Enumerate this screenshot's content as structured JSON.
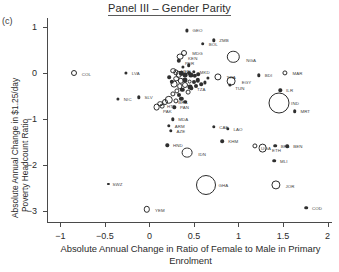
{
  "panel_marker": "(c)",
  "chart_data": {
    "type": "scatter",
    "title": "Panel III – Gender Parity",
    "xlabel": "Absolute Annual Change in Ratio of Female to Male in Primary Enrolment",
    "ylabel_line1": "Absolute Annual Change in $1.25/day",
    "ylabel_line2": "Poverty Headcount Ratio",
    "xlim": [
      -1.15,
      2.05
    ],
    "ylim": [
      -3.25,
      1.2
    ],
    "xticks": [
      -1,
      -0.5,
      0,
      0.5,
      1,
      1.5,
      2
    ],
    "xticklabels": [
      "−1",
      "−0.5",
      "0",
      "0.5",
      "1",
      "1.5",
      "2"
    ],
    "yticks": [
      1,
      0,
      -1,
      -2,
      -3
    ],
    "yticklabels": [
      "1",
      "0",
      "−1",
      "−2",
      "−3"
    ],
    "grid": false,
    "legend": null,
    "marker_note": "Bubble area encodes population; open circles are large bubbles, filled dots are small bubbles",
    "points": [
      {
        "label": "GEO",
        "x": 0.42,
        "y": 0.93,
        "r": 1.6,
        "style": "filled",
        "lx": 4,
        "ly": 0
      },
      {
        "label": "BOL",
        "x": 0.6,
        "y": 0.64,
        "r": 1.8,
        "style": "filled",
        "lx": 4,
        "ly": 0
      },
      {
        "label": "ZMB",
        "x": 0.72,
        "y": 0.72,
        "r": 1.7,
        "style": "filled",
        "lx": 4,
        "ly": 0
      },
      {
        "label": "MDG",
        "x": 0.39,
        "y": 0.44,
        "r": 3.0,
        "style": "open",
        "lx": 5,
        "ly": 0
      },
      {
        "label": "KEN",
        "x": 0.34,
        "y": 0.36,
        "r": 3.4,
        "style": "open",
        "lx": 5,
        "ly": 1
      },
      {
        "label": "PER",
        "x": 0.33,
        "y": 0.27,
        "r": 2.2,
        "style": "filled",
        "lx": 4,
        "ly": 2
      },
      {
        "label": "NGA",
        "x": 0.94,
        "y": 0.36,
        "r": 6.2,
        "style": "open",
        "lx": 7,
        "ly": 3
      },
      {
        "label": "VEN",
        "x": 0.27,
        "y": 0.06,
        "r": 2.8,
        "style": "open",
        "lx": 5,
        "ly": 0
      },
      {
        "label": "COL",
        "x": -0.85,
        "y": 0.0,
        "r": 3.0,
        "style": "open",
        "lx": 5,
        "ly": 1
      },
      {
        "label": "LVA",
        "x": -0.26,
        "y": 0.01,
        "r": 1.6,
        "style": "filled",
        "lx": 4,
        "ly": 0
      },
      {
        "label": "NIC",
        "x": -0.35,
        "y": -0.55,
        "r": 1.6,
        "style": "filled",
        "lx": 4,
        "ly": 0
      },
      {
        "label": "MKD",
        "x": 0.5,
        "y": 0.03,
        "r": 1.7,
        "style": "filled",
        "lx": 4,
        "ly": 0
      },
      {
        "label": "THA",
        "x": 0.77,
        "y": -0.07,
        "r": 3.6,
        "style": "open",
        "lx": 5,
        "ly": 0
      },
      {
        "label": "EGY",
        "x": 0.92,
        "y": -0.17,
        "r": 4.4,
        "style": "open",
        "lx": 6,
        "ly": 1
      },
      {
        "label": "TUN",
        "x": 0.9,
        "y": -0.25,
        "r": 1.6,
        "style": "filled",
        "lx": 4,
        "ly": 3
      },
      {
        "label": "BDI",
        "x": 1.23,
        "y": -0.04,
        "r": 1.7,
        "style": "filled",
        "lx": 4,
        "ly": 0
      },
      {
        "label": "MAR",
        "x": 1.52,
        "y": 0.0,
        "r": 2.6,
        "style": "open",
        "lx": 5,
        "ly": 0
      },
      {
        "label": "ILR",
        "x": 1.47,
        "y": -0.37,
        "r": 1.7,
        "style": "filled",
        "lx": 4,
        "ly": 0
      },
      {
        "label": "IND",
        "x": 1.45,
        "y": -0.65,
        "r": 10.5,
        "style": "open",
        "lx": 0,
        "ly": 0
      },
      {
        "label": "MRT",
        "x": 1.63,
        "y": -0.82,
        "r": 1.8,
        "style": "filled",
        "lx": 4,
        "ly": 0
      },
      {
        "label": "SLV",
        "x": -0.12,
        "y": -0.52,
        "r": 1.7,
        "style": "filled",
        "lx": 4,
        "ly": 0
      },
      {
        "label": "BRA",
        "x": 0.22,
        "y": -0.57,
        "r": 4.2,
        "style": "open",
        "lx": 5,
        "ly": 2
      },
      {
        "label": "HTI",
        "x": 0.12,
        "y": -0.66,
        "r": 2.8,
        "style": "open",
        "lx": 4,
        "ly": 2
      },
      {
        "label": "PAK",
        "x": 0.08,
        "y": -0.74,
        "r": 3.4,
        "style": "open",
        "lx": 3,
        "ly": 4
      },
      {
        "label": "PAN",
        "x": 0.28,
        "y": -0.74,
        "r": 1.7,
        "style": "filled",
        "lx": 4,
        "ly": 0
      },
      {
        "label": "TZA",
        "x": 0.47,
        "y": -0.33,
        "r": 1.7,
        "style": "filled",
        "lx": 4,
        "ly": 1
      },
      {
        "label": "MDA",
        "x": 0.26,
        "y": -1.0,
        "r": 1.7,
        "style": "filled",
        "lx": 4,
        "ly": 0
      },
      {
        "label": "ARM",
        "x": 0.22,
        "y": -1.14,
        "r": 1.7,
        "style": "filled",
        "lx": 4,
        "ly": 0
      },
      {
        "label": "AZE",
        "x": 0.24,
        "y": -1.25,
        "r": 1.7,
        "style": "filled",
        "lx": 4,
        "ly": 0
      },
      {
        "label": "HND",
        "x": 0.2,
        "y": -1.56,
        "r": 1.7,
        "style": "filled",
        "lx": 4,
        "ly": 0
      },
      {
        "label": "IDN",
        "x": 0.42,
        "y": -1.72,
        "r": 5.4,
        "style": "open",
        "lx": 6,
        "ly": 1
      },
      {
        "label": "CAF",
        "x": 0.72,
        "y": -1.16,
        "r": 1.7,
        "style": "filled",
        "lx": 4,
        "ly": 0
      },
      {
        "label": "LAO",
        "x": 0.88,
        "y": -1.2,
        "r": 1.7,
        "style": "filled",
        "lx": 4,
        "ly": 0
      },
      {
        "label": "KHM",
        "x": 0.82,
        "y": -1.47,
        "r": 1.8,
        "style": "filled",
        "lx": 4,
        "ly": 0
      },
      {
        "label": "UGA",
        "x": 1.18,
        "y": -1.57,
        "r": 2.6,
        "style": "open",
        "lx": 4,
        "ly": 2
      },
      {
        "label": "ETH",
        "x": 1.27,
        "y": -1.62,
        "r": 4.4,
        "style": "open",
        "lx": 5,
        "ly": 2
      },
      {
        "label": "BFA",
        "x": 1.41,
        "y": -1.57,
        "r": 1.8,
        "style": "filled",
        "lx": 4,
        "ly": 0
      },
      {
        "label": "BEN",
        "x": 1.55,
        "y": -1.58,
        "r": 1.8,
        "style": "filled",
        "lx": 4,
        "ly": 0
      },
      {
        "label": "MLI",
        "x": 1.4,
        "y": -1.9,
        "r": 1.8,
        "style": "filled",
        "lx": 4,
        "ly": 0
      },
      {
        "label": "GHA",
        "x": 0.64,
        "y": -2.42,
        "r": 10.0,
        "style": "open",
        "lx": 0,
        "ly": 0
      },
      {
        "label": "JOR",
        "x": 1.42,
        "y": -2.42,
        "r": 4.6,
        "style": "open",
        "lx": 5,
        "ly": 1
      },
      {
        "label": "SWZ",
        "x": -0.46,
        "y": -2.4,
        "r": 1.1,
        "style": "filled",
        "lx": 3,
        "ly": 0
      },
      {
        "label": "YEM",
        "x": -0.03,
        "y": -2.95,
        "r": 3.2,
        "style": "open",
        "lx": 5,
        "ly": 1
      },
      {
        "label": "COD",
        "x": 1.76,
        "y": -2.92,
        "r": 1.8,
        "style": "filled",
        "lx": 4,
        "ly": 0
      },
      {
        "label": "",
        "x": 0.3,
        "y": 0.02,
        "r": 2.6,
        "style": "open",
        "lx": 0,
        "ly": 0
      },
      {
        "label": "",
        "x": 0.33,
        "y": -0.02,
        "r": 3.2,
        "style": "open",
        "lx": 0,
        "ly": 0
      },
      {
        "label": "",
        "x": 0.36,
        "y": 0.0,
        "r": 2.2,
        "style": "filled",
        "lx": 0,
        "ly": 0
      },
      {
        "label": "",
        "x": 0.4,
        "y": -0.04,
        "r": 2.4,
        "style": "filled",
        "lx": 0,
        "ly": 0
      },
      {
        "label": "",
        "x": 0.44,
        "y": 0.01,
        "r": 2.0,
        "style": "filled",
        "lx": 0,
        "ly": 0
      },
      {
        "label": "",
        "x": 0.47,
        "y": -0.03,
        "r": 2.6,
        "style": "filled",
        "lx": 0,
        "ly": 0
      },
      {
        "label": "",
        "x": 0.51,
        "y": -0.06,
        "r": 2.2,
        "style": "filled",
        "lx": 0,
        "ly": 0
      },
      {
        "label": "",
        "x": 0.55,
        "y": -0.02,
        "r": 1.8,
        "style": "filled",
        "lx": 0,
        "ly": 0
      },
      {
        "label": "",
        "x": 0.3,
        "y": -0.12,
        "r": 2.8,
        "style": "open",
        "lx": 0,
        "ly": 0
      },
      {
        "label": "",
        "x": 0.35,
        "y": -0.16,
        "r": 3.2,
        "style": "open",
        "lx": 0,
        "ly": 0
      },
      {
        "label": "",
        "x": 0.4,
        "y": -0.14,
        "r": 2.6,
        "style": "filled",
        "lx": 0,
        "ly": 0
      },
      {
        "label": "",
        "x": 0.45,
        "y": -0.18,
        "r": 2.4,
        "style": "open",
        "lx": 0,
        "ly": 0
      },
      {
        "label": "",
        "x": 0.5,
        "y": -0.2,
        "r": 2.0,
        "style": "filled",
        "lx": 0,
        "ly": 0
      },
      {
        "label": "",
        "x": 0.54,
        "y": -0.15,
        "r": 2.2,
        "style": "filled",
        "lx": 0,
        "ly": 0
      },
      {
        "label": "",
        "x": 0.28,
        "y": -0.24,
        "r": 3.4,
        "style": "open",
        "lx": 0,
        "ly": 0
      },
      {
        "label": "",
        "x": 0.34,
        "y": -0.28,
        "r": 2.8,
        "style": "open",
        "lx": 0,
        "ly": 0
      },
      {
        "label": "",
        "x": 0.4,
        "y": -0.26,
        "r": 3.0,
        "style": "open",
        "lx": 0,
        "ly": 0
      },
      {
        "label": "",
        "x": 0.46,
        "y": -0.3,
        "r": 2.4,
        "style": "filled",
        "lx": 0,
        "ly": 0
      },
      {
        "label": "",
        "x": 0.52,
        "y": -0.27,
        "r": 2.0,
        "style": "filled",
        "lx": 0,
        "ly": 0
      },
      {
        "label": "",
        "x": 0.31,
        "y": -0.38,
        "r": 2.6,
        "style": "open",
        "lx": 0,
        "ly": 0
      },
      {
        "label": "",
        "x": 0.37,
        "y": -0.36,
        "r": 2.2,
        "style": "filled",
        "lx": 0,
        "ly": 0
      },
      {
        "label": "",
        "x": 0.43,
        "y": -0.4,
        "r": 2.4,
        "style": "open",
        "lx": 0,
        "ly": 0
      },
      {
        "label": "",
        "x": 0.25,
        "y": -0.18,
        "r": 2.2,
        "style": "filled",
        "lx": 0,
        "ly": 0
      },
      {
        "label": "",
        "x": 0.22,
        "y": -0.08,
        "r": 1.8,
        "style": "filled",
        "lx": 0,
        "ly": 0
      },
      {
        "label": "",
        "x": 0.26,
        "y": -0.44,
        "r": 2.6,
        "style": "open",
        "lx": 0,
        "ly": 0
      },
      {
        "label": "",
        "x": 0.33,
        "y": -0.48,
        "r": 2.0,
        "style": "filled",
        "lx": 0,
        "ly": 0
      },
      {
        "label": "",
        "x": 0.18,
        "y": -0.62,
        "r": 3.0,
        "style": "open",
        "lx": 0,
        "ly": 0
      },
      {
        "label": "",
        "x": 0.3,
        "y": -0.6,
        "r": 2.6,
        "style": "open",
        "lx": 0,
        "ly": 0
      },
      {
        "label": "",
        "x": 0.36,
        "y": -0.56,
        "r": 2.2,
        "style": "filled",
        "lx": 0,
        "ly": 0
      },
      {
        "label": "",
        "x": 0.4,
        "y": -0.62,
        "r": 1.8,
        "style": "filled",
        "lx": 0,
        "ly": 0
      },
      {
        "label": "",
        "x": 0.14,
        "y": -0.72,
        "r": 2.4,
        "style": "open",
        "lx": 0,
        "ly": 0
      },
      {
        "label": "",
        "x": 0.58,
        "y": -0.24,
        "r": 1.8,
        "style": "filled",
        "lx": 0,
        "ly": 0
      },
      {
        "label": "",
        "x": 0.62,
        "y": -0.2,
        "r": 1.6,
        "style": "filled",
        "lx": 0,
        "ly": 0
      },
      {
        "label": "",
        "x": 0.66,
        "y": -0.1,
        "r": 1.6,
        "style": "filled",
        "lx": 0,
        "ly": 0
      },
      {
        "label": "",
        "x": 0.44,
        "y": 0.18,
        "r": 1.8,
        "style": "filled",
        "lx": 0,
        "ly": 0
      },
      {
        "label": "",
        "x": 0.38,
        "y": 0.14,
        "r": 1.6,
        "style": "filled",
        "lx": 0,
        "ly": 0
      }
    ]
  }
}
